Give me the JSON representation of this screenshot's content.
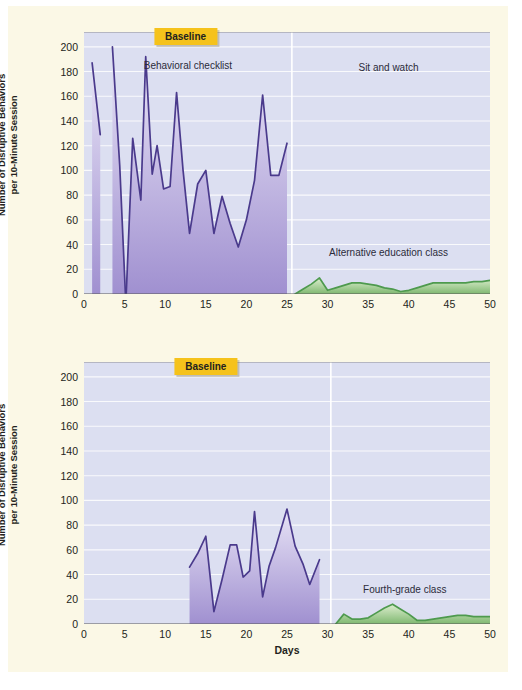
{
  "figure": {
    "background_color": "#fbf8e6",
    "plot_background_color": "#dcdff1",
    "purple_line_color": "#4a3a8c",
    "purple_fill_top": "#e8e4f6",
    "purple_fill_bottom": "#a090d0",
    "green_line_color": "#4e9a4e",
    "green_fill_top": "#ddeecf",
    "green_fill_bottom": "#7fb870",
    "tag_color": "#f5c21b",
    "gridline_color": "#ffffff"
  },
  "axis": {
    "y_title_line1": "Number of Disruptive Behaviors",
    "y_title_line2": "per 10-Minute Session",
    "y_ticks": [
      0,
      20,
      40,
      60,
      80,
      100,
      120,
      140,
      160,
      180,
      200
    ],
    "x_ticks": [
      0,
      5,
      10,
      15,
      20,
      25,
      30,
      35,
      40,
      45,
      50
    ],
    "x_title": "Days",
    "ylim": [
      0,
      212
    ],
    "xlim": [
      0,
      50
    ]
  },
  "panels": [
    {
      "id": "top",
      "labels": {
        "baseline": "Baseline",
        "baseline_x": 12.5,
        "phase_left": "Behavioral checklist",
        "phase_left_x": 12.8,
        "phase_right": "Sit and watch",
        "phase_right_x": 37.5,
        "series_label": "Alternative education class",
        "series_label_x": 37.5
      },
      "phase_line_x": 25.6
    },
    {
      "id": "bottom",
      "labels": {
        "baseline": "Baseline",
        "baseline_x": 15.0,
        "series_label": "Fourth-grade class",
        "series_label_x": 39.5
      },
      "phase_line_x": 30.4
    }
  ],
  "chart_data": [
    {
      "type": "area",
      "panel": "top",
      "title": "Alternative education class",
      "xlabel": "Days",
      "ylabel": "Number of Disruptive Behaviors per 10-Minute Session",
      "xlim": [
        0,
        50
      ],
      "ylim": [
        0,
        212
      ],
      "grid": true,
      "annotations": [
        "Baseline",
        "Behavioral checklist",
        "Sit and watch",
        "Alternative education class"
      ],
      "phase_change_day": 25.6,
      "series": [
        {
          "name": "Behavioral checklist (baseline / intervention A)",
          "color": "#4a3a8c",
          "segments": [
            {
              "x": [
                1,
                2
              ],
              "y": [
                187,
                129
              ]
            },
            {
              "x": [
                3.5,
                4.4,
                5.1
              ],
              "y": [
                200,
                104,
                0
              ]
            },
            {
              "x": [
                5.2,
                6,
                7,
                7.6,
                8.4,
                9,
                9.8,
                10.6,
                11.4,
                12.2,
                13,
                14,
                15,
                16,
                17,
                18,
                19,
                20,
                21,
                22,
                23,
                24,
                25
              ],
              "y": [
                0,
                126,
                76,
                192,
                97,
                120,
                85,
                87,
                163,
                100,
                49,
                89,
                100,
                49,
                79,
                57,
                38,
                60,
                92,
                161,
                96,
                96,
                122
              ]
            }
          ]
        },
        {
          "name": "Alternative education class (treatment)",
          "color": "#4e9a4e",
          "x": [
            26,
            27,
            28,
            29,
            30,
            31,
            32,
            33,
            34,
            35,
            36,
            37,
            38,
            39,
            40,
            41,
            42,
            43,
            44,
            45,
            46,
            47,
            48,
            49,
            50
          ],
          "y": [
            0,
            4,
            8,
            13,
            3,
            5,
            7,
            9,
            9,
            8,
            7,
            5,
            4,
            2,
            3,
            5,
            7,
            9,
            9,
            9,
            9,
            9,
            10,
            10,
            11
          ]
        }
      ]
    },
    {
      "type": "area",
      "panel": "bottom",
      "title": "Fourth-grade class",
      "xlabel": "Days",
      "ylabel": "Number of Disruptive Behaviors per 10-Minute Session",
      "xlim": [
        0,
        50
      ],
      "ylim": [
        0,
        212
      ],
      "grid": true,
      "annotations": [
        "Baseline",
        "Fourth-grade class"
      ],
      "phase_change_day": 30.4,
      "series": [
        {
          "name": "Baseline (behavioral checklist)",
          "color": "#4a3a8c",
          "x": [
            13,
            14,
            15,
            16,
            17,
            18,
            18.8,
            19.6,
            20.4,
            21,
            22,
            22.8,
            23.6,
            25,
            26,
            27,
            27.8,
            29
          ],
          "y": [
            46,
            57,
            71,
            10,
            36,
            64,
            64,
            38,
            43,
            91,
            22,
            47,
            62,
            93,
            63,
            48,
            32,
            52
          ]
        },
        {
          "name": "Fourth-grade class (treatment)",
          "color": "#4e9a4e",
          "x": [
            31,
            32,
            33,
            34,
            35,
            36,
            37,
            38,
            39,
            40,
            41,
            42,
            43,
            44,
            45,
            46,
            47,
            48,
            49,
            50
          ],
          "y": [
            0,
            8,
            4,
            4,
            5,
            9,
            13,
            16,
            12,
            8,
            3,
            3,
            4,
            5,
            6,
            7,
            7,
            6,
            6,
            6
          ]
        }
      ]
    }
  ]
}
